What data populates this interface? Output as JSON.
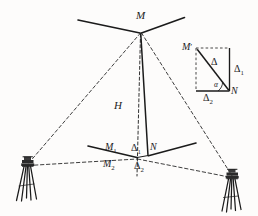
{
  "figure": {
    "background_color": "#fdfcfb",
    "ink_color": "#1b1b1b",
    "labels": {
      "apex": "M",
      "height": "H",
      "base_upper_left": "M",
      "base_upper_left_sub": "1",
      "base_lower_left": "M",
      "base_lower_left_sub": "2",
      "base_right": "N",
      "delta_vertical": "Δ",
      "delta_vertical_sub": "1",
      "delta_horizontal": "Δ",
      "delta_horizontal_sub": "2",
      "inset_top_left": "M",
      "inset_top_left_prime": "′",
      "inset_bottom_right": "N",
      "inset_hypotenuse": "Δ",
      "inset_right_side": "Δ",
      "inset_right_side_sub": "1",
      "inset_bottom_side": "Δ",
      "inset_bottom_side_sub": "2",
      "inset_angle": "α"
    },
    "icons": {
      "left_instrument": "theodolite-tripod-icon",
      "right_instrument": "theodolite-tripod-icon"
    }
  }
}
